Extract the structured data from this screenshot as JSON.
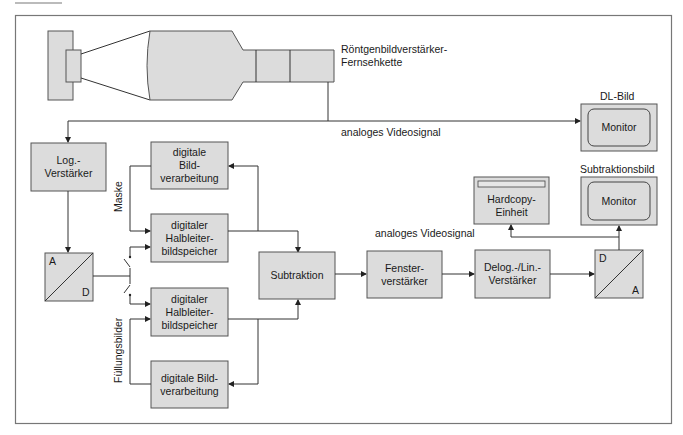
{
  "diagram": {
    "title_label": "Röntgenbildverstärker-Fernsehkette",
    "title_lines": [
      "Röntgenbildverstärker-",
      "Fernsehkette"
    ],
    "signal_label_top": "analoges Videosignal",
    "signal_label_right": "analoges Videosignal",
    "monitor_top_caption": "DL-Bild",
    "monitor_bottom_caption": "Subtraktionsbild",
    "mask_label": "Maske",
    "fill_label": "Füllungsbilder",
    "nodes": {
      "log_amp": [
        "Log.-",
        "Verstärker"
      ],
      "adc": {
        "top": "A",
        "bottom": "D"
      },
      "dip_top": [
        "digitale",
        "Bild-",
        "verarbeitung"
      ],
      "mem_top": [
        "digitaler",
        "Halbleiter-",
        "bildspeicher"
      ],
      "mem_bottom": [
        "digitaler",
        "Halbleiter-",
        "bildspeicher"
      ],
      "dip_bottom": [
        "digitale Bild-",
        "verarbeitung"
      ],
      "subtraction": [
        "Subtraktion"
      ],
      "window_amp": [
        "Fenster-",
        "verstärker"
      ],
      "delog_amp": [
        "Delog.-/Lin.-",
        "Verstärker"
      ],
      "dac": {
        "top": "D",
        "bottom": "A"
      },
      "hardcopy": [
        "Hardcopy-",
        "Einheit"
      ],
      "monitor_top": "Monitor",
      "monitor_bottom": "Monitor"
    },
    "colors": {
      "box_fill": "#dcdcdc",
      "stroke": "#333333",
      "frame": "#777777"
    }
  }
}
